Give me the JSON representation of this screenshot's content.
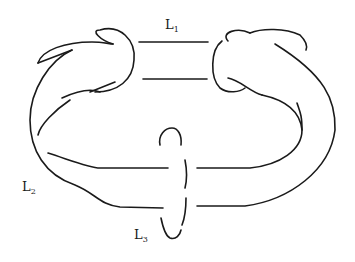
{
  "diagram": {
    "type": "link-diagram",
    "components": [
      {
        "id": "L1",
        "label": "L",
        "subscript": "1"
      },
      {
        "id": "L2",
        "label": "L",
        "subscript": "2"
      },
      {
        "id": "L3",
        "label": "L",
        "subscript": "3"
      }
    ],
    "stroke_color": "#1a1a1a",
    "background": "#ffffff"
  }
}
